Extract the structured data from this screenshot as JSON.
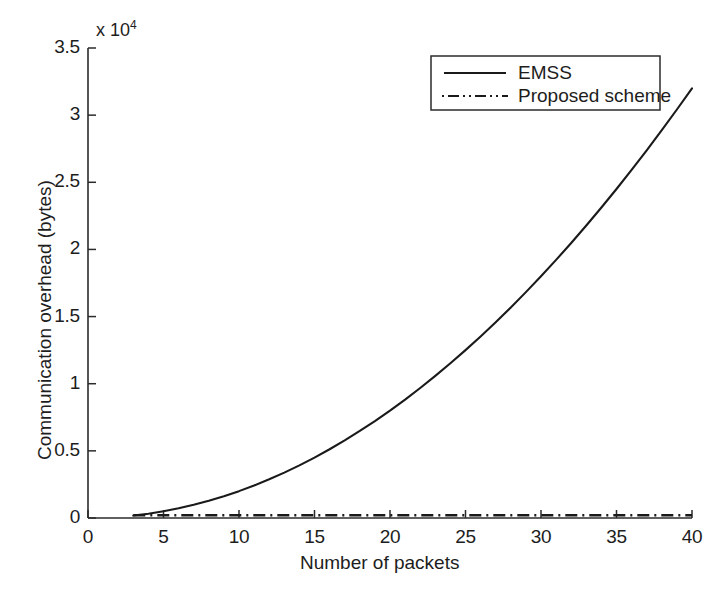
{
  "chart_data": {
    "type": "line",
    "title": "",
    "xlabel": "Number of packets",
    "ylabel": "Communication overhead (bytes)",
    "y_exponent_label": "x 10",
    "y_exponent_power": "4",
    "y_scale_factor": 10000,
    "xlim": [
      0,
      40
    ],
    "ylim": [
      0,
      35000
    ],
    "xticks": [
      0,
      5,
      10,
      15,
      20,
      25,
      30,
      35,
      40
    ],
    "xtick_labels": [
      "0",
      "5",
      "10",
      "15",
      "20",
      "25",
      "30",
      "35",
      "40"
    ],
    "yticks": [
      0,
      5000,
      10000,
      15000,
      20000,
      25000,
      30000,
      35000
    ],
    "ytick_labels": [
      "0",
      "0.5",
      "1",
      "1.5",
      "2",
      "2.5",
      "3",
      "3.5"
    ],
    "grid": false,
    "legend_position": "upper right",
    "series": [
      {
        "name": "EMSS",
        "linestyle": "solid",
        "color": "#1a1a1a",
        "x": [
          3,
          4,
          5,
          6,
          7,
          8,
          9,
          10,
          11,
          12,
          13,
          14,
          15,
          16,
          17,
          18,
          19,
          20,
          21,
          22,
          23,
          24,
          25,
          26,
          27,
          28,
          29,
          30,
          31,
          32,
          33,
          34,
          35,
          36,
          37,
          38,
          39,
          40
        ],
        "values": [
          180,
          320,
          500,
          720,
          980,
          1280,
          1620,
          2000,
          2420,
          2880,
          3380,
          3920,
          4500,
          5120,
          5780,
          6480,
          7220,
          8000,
          8820,
          9680,
          10580,
          11520,
          12500,
          13520,
          14580,
          15680,
          16820,
          18000,
          19220,
          20480,
          21780,
          23120,
          24500,
          25920,
          27380,
          28880,
          30420,
          32000
        ]
      },
      {
        "name": "Proposed scheme",
        "linestyle": "dashdot",
        "color": "#1a1a1a",
        "x": [
          3,
          40
        ],
        "values": [
          200,
          200
        ]
      }
    ]
  },
  "legend": {
    "entries": [
      {
        "label": "EMSS",
        "style": "solid"
      },
      {
        "label": "Proposed scheme",
        "style": "dashdot"
      }
    ]
  },
  "axes": {
    "x_title": "Number of packets",
    "y_title": "Communication overhead (bytes)",
    "exponent_prefix": "x 10",
    "exponent_power": "4",
    "x_tick_labels": [
      "0",
      "5",
      "10",
      "15",
      "20",
      "25",
      "30",
      "35",
      "40"
    ],
    "y_tick_labels": [
      "0",
      "0.5",
      "1",
      "1.5",
      "2",
      "2.5",
      "3",
      "3.5"
    ]
  },
  "colors": {
    "line": "#1a1a1a",
    "axis": "#2b2b2b",
    "background": "#ffffff"
  }
}
